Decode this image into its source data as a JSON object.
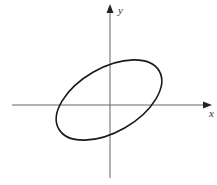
{
  "diagram": {
    "type": "coordinate-plane-with-ellipse",
    "axes": {
      "x_label": "x",
      "y_label": "y",
      "origin_px": [
        110,
        105
      ],
      "x_axis_px": [
        12,
        211
      ],
      "y_axis_px": [
        178,
        5
      ]
    },
    "ellipse": {
      "center_px": [
        109,
        100
      ],
      "rx": 58,
      "ry": 32,
      "rotation_deg": -30,
      "stroke": "#1a1a1a"
    },
    "colors": {
      "axis": "#666666",
      "curve": "#1a1a1a",
      "background": "#ffffff"
    }
  }
}
